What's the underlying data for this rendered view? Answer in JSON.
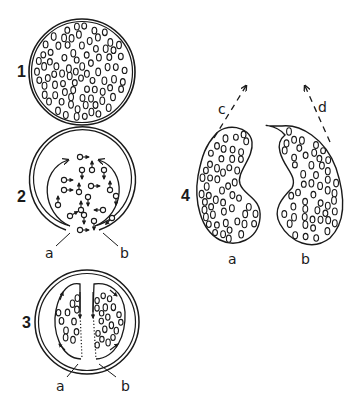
{
  "diagram": {
    "ink_color": "#1a1a1a",
    "background": "#ffffff",
    "stages": [
      {
        "number": "1",
        "description": "Closed sphere packed with small round cells"
      },
      {
        "number": "2",
        "description": "Sphere opening at bottom, cells with directional arrows; arrows circulate along inner walls",
        "labels": [
          "a",
          "b"
        ]
      },
      {
        "number": "3",
        "description": "Sphere divided into two half-masses by dotted cleavage; arrows circulate in each half",
        "labels": [
          "a",
          "b"
        ]
      },
      {
        "number": "4",
        "description": "Two kidney-shaped halves separating, dashed arrows indicate direction of movement",
        "labels": [
          "a",
          "b"
        ],
        "arrow_labels": [
          "c",
          "d"
        ]
      }
    ]
  }
}
